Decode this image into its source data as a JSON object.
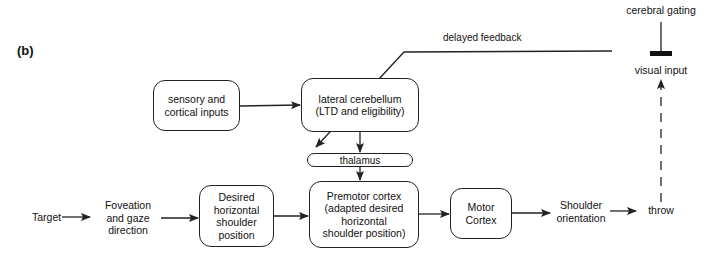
{
  "figure": {
    "panel_label": "(b)",
    "nodes": {
      "target": {
        "label": "Target"
      },
      "foveation": {
        "lines": [
          "Foveation",
          "and gaze",
          "direction"
        ]
      },
      "desired": {
        "lines": [
          "Desired",
          "horizontal",
          "shoulder",
          "position"
        ]
      },
      "premotor": {
        "lines": [
          "Premotor cortex",
          "(adapted desired",
          "horizontal",
          "shoulder position)"
        ]
      },
      "motor": {
        "lines": [
          "Motor",
          "Cortex"
        ]
      },
      "shoulder": {
        "lines": [
          "Shoulder",
          "orientation"
        ]
      },
      "throw": {
        "label": "throw"
      },
      "sensory": {
        "lines": [
          "sensory and",
          "cortical inputs"
        ]
      },
      "cerebellum": {
        "lines": [
          "lateral cerebellum",
          "(LTD and eligibility)"
        ]
      },
      "thalamus": {
        "label": "thalamus"
      },
      "visual_input": {
        "label": "visual input"
      },
      "cerebral_gating": {
        "label": "cerebral gating"
      }
    },
    "edges": {
      "delayed_feedback": {
        "label": "delayed feedback"
      }
    },
    "colors": {
      "stroke": "#222222",
      "background": "#ffffff"
    }
  }
}
